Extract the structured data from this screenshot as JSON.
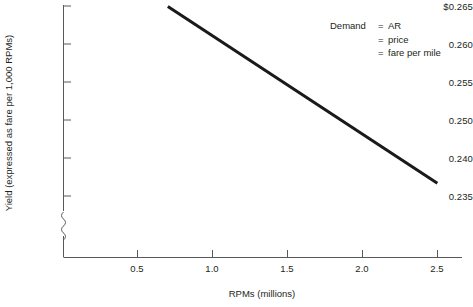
{
  "chart_data": {
    "type": "line",
    "title": "",
    "xlabel": "RPMs (millions)",
    "ylabel": "Yield (expressed as fare per 1,000 RPMs)",
    "xlim": [
      0.0,
      2.75
    ],
    "ylim": [
      0.2305,
      0.2655
    ],
    "xticks": [
      "0.5",
      "1.0",
      "1.5",
      "2.0",
      "2.5"
    ],
    "xtick_values": [
      0.5,
      1.0,
      1.5,
      2.0,
      2.5
    ],
    "yticks": [
      "$0.265",
      "0.260",
      "0.255",
      "0.250",
      "0.240",
      "0.235"
    ],
    "ytick_values": [
      0.265,
      0.26,
      0.255,
      0.25,
      0.245,
      0.24
    ],
    "y_axis_break": true,
    "grid": false,
    "legend": "none",
    "series": [
      {
        "name": "Demand = AR = price = fare per mile",
        "x": [
          0.72,
          2.58
        ],
        "y": [
          0.2653,
          0.2408
        ],
        "color": "#1a1a1a",
        "width": 3
      }
    ],
    "annotations": [
      {
        "lead": "Demand",
        "eq": "=",
        "text": "AR"
      },
      {
        "lead": "",
        "eq": "=",
        "text": "price"
      },
      {
        "lead": "",
        "eq": "=",
        "text": "fare per mile"
      }
    ]
  },
  "colors": {
    "line": "#1a1a1a",
    "axis": "#58595b",
    "text": "#231f20",
    "background": "#ffffff"
  }
}
